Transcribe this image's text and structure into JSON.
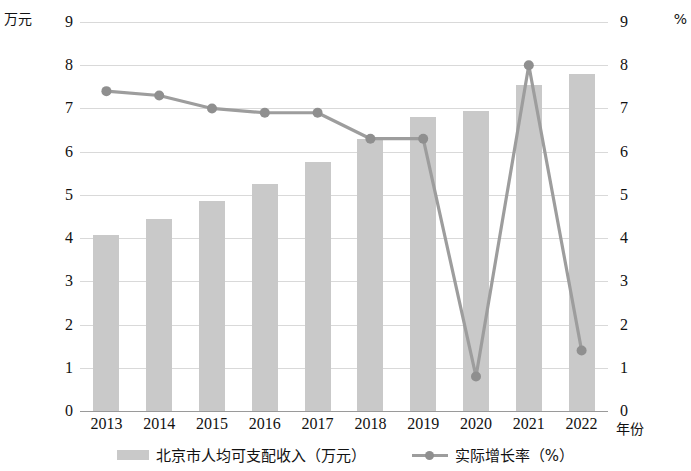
{
  "axes": {
    "left_unit": "万元",
    "right_unit": "%",
    "x_title": "年份"
  },
  "legend": {
    "items": [
      {
        "label": "北京市人均可支配收入（万元）",
        "marker": "bar-swatch",
        "color": "#c9c9c9"
      },
      {
        "label": "实际增长率（%）",
        "marker": "line-marker",
        "color": "#9d9d9d"
      }
    ]
  },
  "colors": {
    "bar": "#c9c9c9",
    "line": "#9d9d9d",
    "marker": "#8f8f8f",
    "grid": "#d9d9d9",
    "axis": "#9a9a9a",
    "text": "#111111"
  },
  "chart_data": {
    "type": "bar",
    "title": "",
    "subtitle": "",
    "xlabel": "年份",
    "ylabel": "万元",
    "y2label": "%",
    "categories": [
      "2013",
      "2014",
      "2015",
      "2016",
      "2017",
      "2018",
      "2019",
      "2020",
      "2021",
      "2022"
    ],
    "ylim": [
      0,
      9
    ],
    "y2lim": [
      0,
      9
    ],
    "yticks": [
      "0",
      "1",
      "2",
      "3",
      "4",
      "5",
      "6",
      "7",
      "8",
      "9"
    ],
    "y2ticks": [
      "0",
      "1",
      "2",
      "3",
      "4",
      "5",
      "6",
      "7",
      "8",
      "9"
    ],
    "grid": true,
    "legend_position": "bottom",
    "series": [
      {
        "name": "北京市人均可支配收入（万元）",
        "type": "bar",
        "axis": "left",
        "unit": "万元",
        "values": [
          4.08,
          4.45,
          4.85,
          5.25,
          5.75,
          6.3,
          6.8,
          6.95,
          7.55,
          7.8
        ]
      },
      {
        "name": "实际增长率（%）",
        "type": "line",
        "axis": "right",
        "unit": "%",
        "values": [
          7.4,
          7.3,
          7.0,
          6.9,
          6.9,
          6.3,
          6.3,
          0.8,
          8.0,
          1.4
        ]
      }
    ]
  }
}
